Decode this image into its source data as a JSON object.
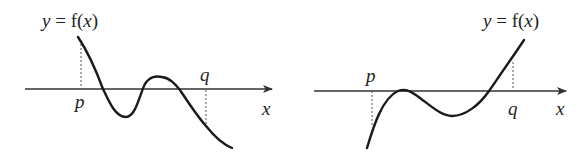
{
  "graphs": [
    {
      "curve_label_y": "y",
      "curve_label_eq": " = f(",
      "curve_label_x": "x",
      "curve_label_close": ")",
      "point_p": "p",
      "point_q": "q",
      "axis_label": "x"
    },
    {
      "curve_label_y": "y",
      "curve_label_eq": " = f(",
      "curve_label_x": "x",
      "curve_label_close": ")",
      "point_p": "p",
      "point_q": "q",
      "axis_label": "x"
    }
  ],
  "colors": {
    "curve": "#1a1a1a",
    "axis": "#333333",
    "background": "#ffffff"
  }
}
